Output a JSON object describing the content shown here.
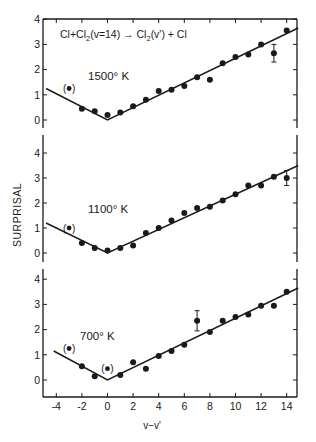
{
  "chart_data": {
    "type": "scatter",
    "title": "Cl+Cl2(v=14) → Cl2(v') + Cl",
    "xlabel": "v−v'",
    "ylabel": "SURPRISAL",
    "xlim": [
      -4.8,
      14.9
    ],
    "ylim": [
      -0.7,
      4
    ],
    "x_ticks": [
      -4,
      -2,
      0,
      2,
      4,
      6,
      8,
      10,
      12,
      14
    ],
    "y_ticks": [
      0,
      1,
      2,
      3,
      4
    ],
    "grid": false,
    "panels": [
      {
        "label": "1500° K",
        "x": [
          -3,
          -2,
          -1,
          0,
          1,
          2,
          3,
          4,
          5,
          6,
          7,
          8,
          9,
          10,
          11,
          12,
          13,
          14
        ],
        "y": [
          1.25,
          0.45,
          0.35,
          0.2,
          0.3,
          0.55,
          0.8,
          1.15,
          1.2,
          1.35,
          1.7,
          1.6,
          2.25,
          2.5,
          2.6,
          3.0,
          2.65,
          3.55
        ],
        "parenthesized": [
          -3
        ],
        "error_bars": [
          {
            "x": 13,
            "y": 2.65,
            "err": 0.35
          }
        ],
        "fit_line": [
          [
            -4.8,
            1.25
          ],
          [
            0,
            0
          ],
          [
            14.9,
            3.65
          ]
        ]
      },
      {
        "label": "1100° K",
        "x": [
          -3,
          -2,
          -1,
          0,
          1,
          2,
          3,
          4,
          5,
          6,
          7,
          8,
          9,
          10,
          11,
          12,
          13,
          14
        ],
        "y": [
          1.0,
          0.4,
          0.2,
          0.1,
          0.2,
          0.3,
          0.8,
          1.0,
          1.3,
          1.6,
          1.8,
          1.85,
          2.1,
          2.35,
          2.7,
          2.7,
          3.05,
          3.0
        ],
        "parenthesized": [
          -3
        ],
        "error_bars": [
          {
            "x": 14,
            "y": 3.0,
            "err": 0.3
          }
        ],
        "fit_line": [
          [
            -4.8,
            1.2
          ],
          [
            0,
            0
          ],
          [
            14.9,
            3.5
          ]
        ]
      },
      {
        "label": "700° K",
        "x": [
          -3,
          -2,
          -1,
          0,
          1,
          2,
          3,
          4,
          5,
          6,
          7,
          8,
          9,
          10,
          11,
          12,
          13,
          14
        ],
        "y": [
          1.25,
          0.55,
          0.15,
          0.45,
          0.2,
          0.7,
          0.45,
          0.95,
          1.15,
          1.4,
          2.35,
          1.9,
          2.35,
          2.5,
          2.6,
          2.95,
          2.95,
          3.5
        ],
        "parenthesized": [
          -3,
          0
        ],
        "error_bars": [
          {
            "x": 7,
            "y": 2.35,
            "err": 0.4
          }
        ],
        "fit_line": [
          [
            -4.2,
            1.15
          ],
          [
            0,
            0
          ],
          [
            14.9,
            3.65
          ]
        ]
      }
    ]
  },
  "labels": {
    "title_prefix": "Cl+Cl",
    "title_sub1": "2",
    "title_mid": "(v=14) → Cl",
    "title_sub2": "2",
    "title_suffix": "(v') + Cl",
    "ylabel": "SURPRISAL",
    "xlabel": "v−v'",
    "panel_labels": [
      "1500° K",
      "1100° K",
      "700° K"
    ],
    "x_tick_labels": [
      "-4",
      "-2",
      "0",
      "2",
      "4",
      "6",
      "8",
      "10",
      "12",
      "14"
    ],
    "y_tick_labels": [
      "0",
      "1",
      "2",
      "3",
      "4"
    ]
  }
}
